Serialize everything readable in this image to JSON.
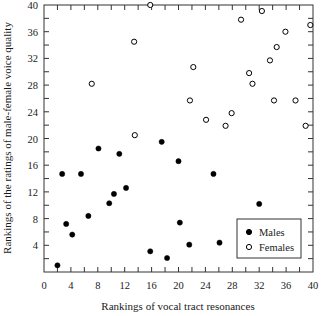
{
  "chart_data": {
    "type": "scatter",
    "title": "",
    "xlabel": "Rankings of vocal tract resonances",
    "ylabel": "Rankings of the ratings of male-female voice quality",
    "xlim": [
      0,
      40
    ],
    "ylim": [
      0,
      40
    ],
    "xticks": [
      0,
      4,
      8,
      12,
      16,
      20,
      24,
      28,
      32,
      36,
      40
    ],
    "yticks": [
      0,
      4,
      8,
      12,
      16,
      20,
      24,
      28,
      32,
      36,
      40
    ],
    "xtick_labels": [
      "0",
      "4",
      "8",
      "12",
      "16",
      "20",
      "24",
      "28",
      "32",
      "36",
      "40"
    ],
    "ytick_labels": [
      "0",
      "4",
      "8",
      "12",
      "16",
      "20",
      "24",
      "28",
      "32",
      "36",
      "40"
    ],
    "minor_tick_step": 2,
    "grid": false,
    "legend_position": "lower right",
    "series": [
      {
        "name": "Males",
        "marker": "filled-circle",
        "color": "#000000",
        "points": [
          [
            2.0,
            1.0
          ],
          [
            2.7,
            14.7
          ],
          [
            3.3,
            7.2
          ],
          [
            4.2,
            5.6
          ],
          [
            5.5,
            14.7
          ],
          [
            6.6,
            8.4
          ],
          [
            8.1,
            18.5
          ],
          [
            9.7,
            10.3
          ],
          [
            10.4,
            11.7
          ],
          [
            11.2,
            17.7
          ],
          [
            12.2,
            12.6
          ],
          [
            15.8,
            3.1
          ],
          [
            17.5,
            19.5
          ],
          [
            18.3,
            2.1
          ],
          [
            20.0,
            16.6
          ],
          [
            20.2,
            7.4
          ],
          [
            21.6,
            4.1
          ],
          [
            25.2,
            14.7
          ],
          [
            26.1,
            4.4
          ],
          [
            32.0,
            10.2
          ]
        ]
      },
      {
        "name": "Females",
        "marker": "open-circle",
        "color": "#000000",
        "points": [
          [
            7.1,
            28.2
          ],
          [
            13.4,
            34.5
          ],
          [
            13.5,
            20.5
          ],
          [
            15.8,
            40.0
          ],
          [
            21.7,
            25.7
          ],
          [
            22.2,
            30.7
          ],
          [
            24.1,
            22.8
          ],
          [
            27.0,
            21.9
          ],
          [
            27.9,
            23.8
          ],
          [
            29.3,
            37.8
          ],
          [
            30.5,
            29.8
          ],
          [
            31.0,
            28.2
          ],
          [
            32.4,
            39.1
          ],
          [
            33.6,
            31.7
          ],
          [
            34.2,
            25.7
          ],
          [
            34.6,
            33.7
          ],
          [
            35.9,
            36.0
          ],
          [
            37.4,
            25.7
          ],
          [
            38.9,
            21.9
          ],
          [
            39.6,
            37.0
          ]
        ]
      }
    ]
  },
  "legend": {
    "items": [
      {
        "label": "Males",
        "marker": "filled-circle"
      },
      {
        "label": "Females",
        "marker": "open-circle"
      }
    ]
  }
}
